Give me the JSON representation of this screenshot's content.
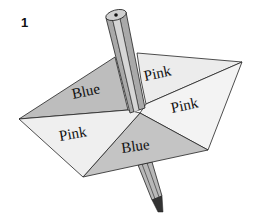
{
  "figure": {
    "number": "1",
    "sectors": [
      {
        "label": "Blue",
        "position": "upper-left",
        "shade": "#bdbdbd"
      },
      {
        "label": "Pink",
        "position": "upper-right",
        "shade": "#ededed"
      },
      {
        "label": "Pink",
        "position": "right",
        "shade": "#f2f2f2"
      },
      {
        "label": "Blue",
        "position": "bottom",
        "shade": "#c4c4c4"
      },
      {
        "label": "Pink",
        "position": "left",
        "shade": "#efefef"
      }
    ],
    "colors": {
      "blue_sector": "#bdbdbd",
      "pink_sector": "#efefef",
      "pencil_dark": "#8a8a8a",
      "pencil_light": "#c8c8c8",
      "outline": "#222222"
    }
  }
}
